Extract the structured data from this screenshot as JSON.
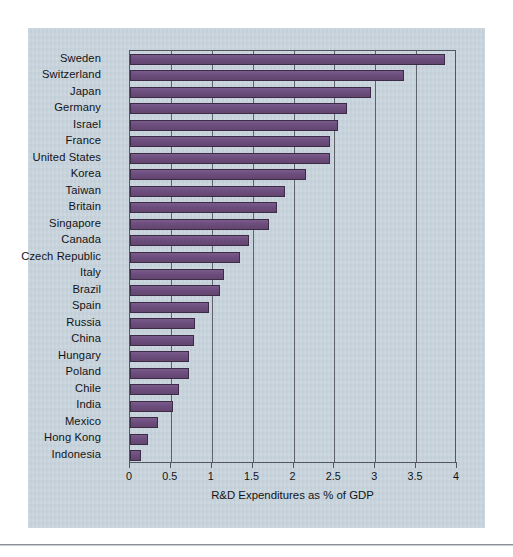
{
  "figure": {
    "panel_color": "#c7d3dd",
    "bar_color": "#6c4d7d",
    "bar_edge_color": "#3c2b46",
    "axis_color": "#53565c"
  },
  "chart_data": {
    "type": "bar",
    "orientation": "horizontal",
    "title": "",
    "xlabel": "R&D Expenditures as % of GDP",
    "ylabel": "",
    "xlim": [
      0,
      4
    ],
    "xticks": [
      0,
      0.5,
      1,
      1.5,
      2,
      2.5,
      3,
      3.5,
      4
    ],
    "xtick_labels": [
      "0",
      "0.5",
      "1",
      "1.5",
      "2",
      "2.5",
      "3",
      "3.5",
      "4"
    ],
    "grid": "vertical",
    "legend": "none",
    "categories": [
      "Sweden",
      "Switzerland",
      "Japan",
      "Germany",
      "Israel",
      "France",
      "United States",
      "Korea",
      "Taiwan",
      "Britain",
      "Singapore",
      "Canada",
      "Czech Republic",
      "Italy",
      "Brazil",
      "Spain",
      "Russia",
      "China",
      "Hungary",
      "Poland",
      "Chile",
      "India",
      "Mexico",
      "Hong Kong",
      "Indonesia"
    ],
    "values": [
      3.85,
      3.35,
      2.95,
      2.65,
      2.55,
      2.45,
      2.45,
      2.15,
      1.9,
      1.8,
      1.7,
      1.45,
      1.35,
      1.15,
      1.1,
      0.97,
      0.8,
      0.78,
      0.72,
      0.72,
      0.6,
      0.52,
      0.34,
      0.22,
      0.14
    ]
  }
}
